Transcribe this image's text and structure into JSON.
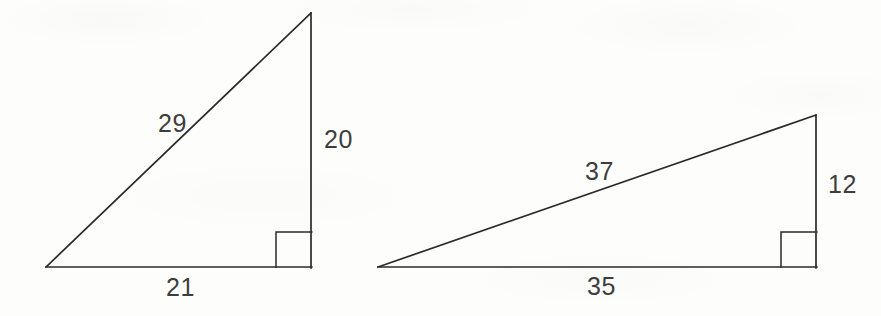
{
  "figure": {
    "background_color": "#fdfdfc",
    "line_color": "#2a2a2a",
    "label_color": "#3d3d3d"
  },
  "triangles": [
    {
      "name": "left-triangle",
      "right_angle_marker": true,
      "labels": {
        "hypotenuse": "29",
        "vertical_leg": "20",
        "horizontal_leg": "21"
      },
      "geometry": {
        "left_vertex": [
          46,
          267
        ],
        "apex": [
          311,
          13
        ],
        "right_vertex": [
          311,
          267
        ],
        "marker_size": 35
      }
    },
    {
      "name": "right-triangle",
      "right_angle_marker": true,
      "labels": {
        "hypotenuse": "37",
        "vertical_leg": "12",
        "horizontal_leg": "35"
      },
      "geometry": {
        "left_vertex": [
          378,
          267
        ],
        "apex": [
          816,
          115
        ],
        "right_vertex": [
          816,
          267
        ],
        "marker_size": 35
      }
    }
  ],
  "label_positions": {
    "left_hypotenuse": {
      "x": 158,
      "y": 111
    },
    "left_vertical": {
      "x": 324,
      "y": 127
    },
    "left_horizontal": {
      "x": 166,
      "y": 275
    },
    "right_hypotenuse": {
      "x": 585,
      "y": 159
    },
    "right_vertical": {
      "x": 828,
      "y": 172
    },
    "right_horizontal": {
      "x": 587,
      "y": 274
    }
  }
}
